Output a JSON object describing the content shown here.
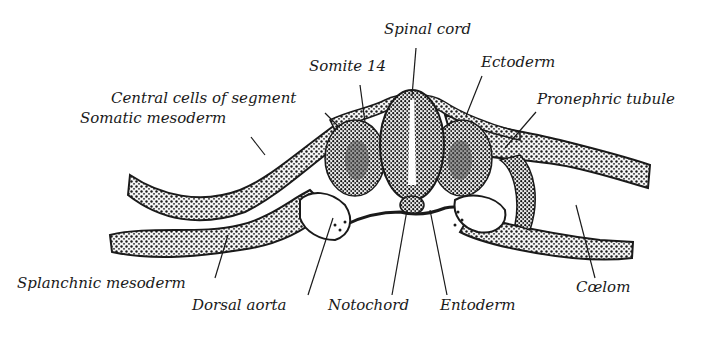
{
  "diagram": {
    "type": "anatomical-cross-section",
    "colors": {
      "ink": "#1a1a1a",
      "background": "#ffffff",
      "tissue_light": "#f2f2f2"
    },
    "labels": {
      "spinal_cord": "Spinal cord",
      "somite_14": "Somite 14",
      "ectoderm": "Ectoderm",
      "central_cells": "Central cells of segment",
      "pronephric_tubule": "Pronephric tubule",
      "somatic_mesoderm": "Somatic mesoderm",
      "splanchnic_mesoderm": "Splanchnic mesoderm",
      "dorsal_aorta": "Dorsal aorta",
      "notochord": "Notochord",
      "entoderm": "Entoderm",
      "coelom": "Cœlom"
    }
  }
}
